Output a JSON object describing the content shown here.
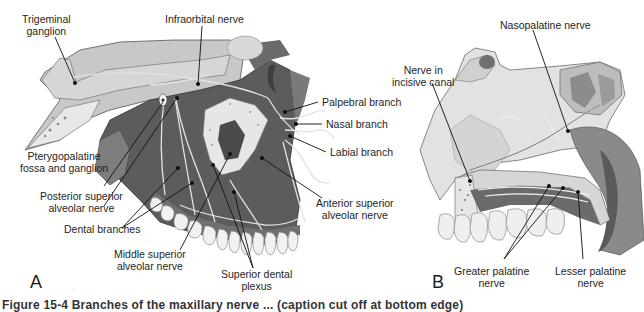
{
  "figure": {
    "panels": [
      {
        "id": "A",
        "letter": "A",
        "labels": {
          "trigeminal_ganglion": [
            "Trigeminal",
            "ganglion"
          ],
          "infraorbital_nerve": "Infraorbital nerve",
          "palpebral_branch": "Palpebral branch",
          "nasal_branch": "Nasal branch",
          "labial_branch": "Labial branch",
          "pterygopalatine": [
            "Pterygopalatine",
            "fossa and ganglion"
          ],
          "posterior_superior_alveolar": [
            "Posterior superior",
            "alveolar nerve"
          ],
          "dental_branches": "Dental branches",
          "anterior_superior_alveolar": [
            "Anterior superior",
            "alveolar nerve"
          ],
          "middle_superior_alveolar": [
            "Middle superior",
            "alveolar nerve"
          ],
          "superior_dental_plexus": [
            "Superior dental",
            "plexus"
          ]
        }
      },
      {
        "id": "B",
        "letter": "B",
        "labels": {
          "nasopalatine_nerve": "Nasopalatine nerve",
          "nerve_in_incisive_canal": [
            "Nerve in",
            "incisive canal"
          ],
          "greater_palatine_nerve": [
            "Greater palatine",
            "nerve"
          ],
          "lesser_palatine_nerve": [
            "Lesser palatine",
            "nerve"
          ]
        }
      }
    ],
    "caption_partial": "Figure 15-4 Branches of the maxillary nerve ... (caption cut off at bottom edge)"
  },
  "colors": {
    "background": "#ffffff",
    "tissue_dark": "#5a5a5a",
    "tissue_mid": "#8a8a8a",
    "bone_light": "#d9d9d9",
    "tooth": "#f2f2f2",
    "nerve": "#e6e6e6",
    "leader_line": "#111111"
  }
}
